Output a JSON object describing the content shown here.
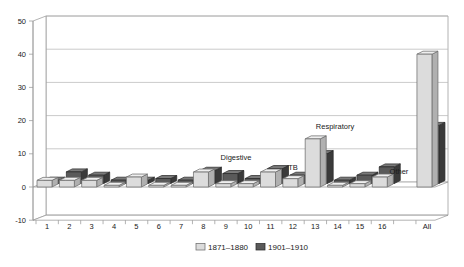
{
  "chart_data": {
    "type": "bar",
    "projection": "3d",
    "title": "",
    "xlabel": "",
    "ylabel": "",
    "categories": [
      "1",
      "2",
      "3",
      "4",
      "5",
      "6",
      "7",
      "8",
      "9",
      "10",
      "11",
      "12",
      "13",
      "14",
      "15",
      "16",
      "All"
    ],
    "series": [
      {
        "name": "1871–1880",
        "color": "#dcdcdc",
        "values": [
          2,
          2,
          2,
          0.5,
          3,
          0.5,
          0.5,
          4.5,
          1,
          1,
          4.5,
          2.5,
          14.5,
          0.5,
          1,
          3,
          40
        ]
      },
      {
        "name": "1901–1910",
        "color": "#5a5a5a",
        "values": [
          1,
          3.5,
          2.5,
          1,
          1,
          1.5,
          1,
          4,
          3,
          1.5,
          4.5,
          2.5,
          9,
          1,
          2.5,
          5,
          17.5
        ]
      }
    ],
    "ylim": [
      -10,
      50
    ],
    "yticks": [
      50,
      40,
      30,
      20,
      10,
      0,
      -10
    ],
    "grid": true,
    "legend_position": "bottom-center",
    "annotations": [
      {
        "text": "Digestive",
        "cx": 236,
        "cy": 160
      },
      {
        "text": "TB",
        "cx": 293,
        "cy": 170
      },
      {
        "text": "Respiratory",
        "cx": 335,
        "cy": 129
      },
      {
        "text": "Other",
        "cx": 399,
        "cy": 174
      }
    ],
    "colors": {
      "light_front": "#dcdcdc",
      "light_top": "#efefef",
      "light_side": "#b0b0b0",
      "light_stroke": "#6e6e6e",
      "dark_front": "#5a5a5a",
      "dark_top": "#7a7a7a",
      "dark_side": "#3a3a3a",
      "dark_stroke": "#2b2b2b",
      "wall_fill": "#ffffff",
      "wall_stroke": "#9a9a9a",
      "gridline": "#b8b8b8",
      "text": "#1a1a1a"
    }
  }
}
